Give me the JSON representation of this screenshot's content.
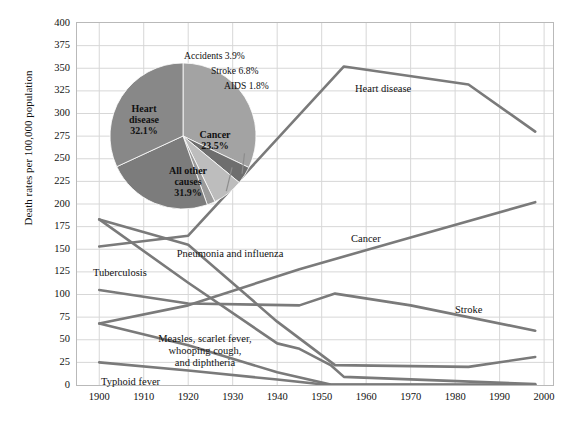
{
  "chart_data": {
    "type": "line",
    "title": "",
    "xlabel": "",
    "ylabel": "Death rates per 100,000 population",
    "xlim": [
      1895,
      2002
    ],
    "ylim": [
      0,
      400
    ],
    "ytick_step": 25,
    "grid": true,
    "legend_position": "inline-labels",
    "yticks": [
      "400",
      "375",
      "350",
      "325",
      "300",
      "275",
      "250",
      "225",
      "200",
      "175",
      "150",
      "125",
      "100",
      "75",
      "50",
      "25",
      "0"
    ],
    "xticks": [
      "1900",
      "1910",
      "1920",
      "1930",
      "1940",
      "1950",
      "1960",
      "1970",
      "1980",
      "1990",
      "2000"
    ],
    "series": [
      {
        "name": "Heart disease",
        "label": "Heart disease",
        "color": "#7a7a7a",
        "x": [
          1900,
          1920,
          1955,
          1983,
          1998
        ],
        "values": [
          153,
          165,
          352,
          332,
          280
        ]
      },
      {
        "name": "Cancer",
        "label": "Cancer",
        "color": "#7a7a7a",
        "x": [
          1900,
          1920,
          1945,
          1970,
          1998
        ],
        "values": [
          68,
          88,
          128,
          163,
          202
        ]
      },
      {
        "name": "Stroke",
        "label": "Stroke",
        "color": "#7a7a7a",
        "x": [
          1900,
          1920,
          1945,
          1953,
          1970,
          1998
        ],
        "values": [
          105,
          90,
          88,
          101,
          88,
          60
        ]
      },
      {
        "name": "Pneumonia and influenza",
        "label": "Pneumonia and influenza",
        "color": "#7a7a7a",
        "x": [
          1900,
          1920,
          1940,
          1950,
          1953,
          1983,
          1998
        ],
        "values": [
          183,
          155,
          70,
          33,
          22,
          20,
          31
        ]
      },
      {
        "name": "Tuberculosis",
        "label": "Tuberculosis",
        "color": "#7a7a7a",
        "x": [
          1900,
          1920,
          1940,
          1945,
          1952,
          1955,
          1998
        ],
        "values": [
          183,
          113,
          46,
          40,
          22,
          9,
          1
        ]
      },
      {
        "name": "Measles, scarlet fever, whooping cough, and diphtheria",
        "label": "Measles, scarlet fever,\nwhooping cough,\nand diphtheria",
        "color": "#7a7a7a",
        "x": [
          1900,
          1920,
          1940,
          1952,
          1998
        ],
        "values": [
          68,
          44,
          14,
          0.5,
          0.2
        ]
      },
      {
        "name": "Typhoid fever",
        "label": "Typhoid fever",
        "color": "#7a7a7a",
        "x": [
          1900,
          1920,
          1940,
          1950,
          1998
        ],
        "values": [
          25,
          16,
          6,
          0.8,
          0.2
        ]
      }
    ],
    "pie": {
      "title": "",
      "slices": [
        {
          "label": "Heart disease",
          "pct_label": "32.1%",
          "value": 32.1,
          "color": "#a3a3a3"
        },
        {
          "label": "Accidents",
          "pct_label": "3.9%",
          "value": 3.9,
          "color": "#6e6e6e"
        },
        {
          "label": "Stroke",
          "pct_label": "6.8%",
          "value": 6.8,
          "color": "#bdbdbd"
        },
        {
          "label": "AIDS",
          "pct_label": "1.8%",
          "value": 1.8,
          "color": "#9b9b9b"
        },
        {
          "label": "Cancer",
          "pct_label": "23.5%",
          "value": 23.5,
          "color": "#7c7c7c"
        },
        {
          "label": "All other causes",
          "pct_label": "31.9%",
          "value": 31.9,
          "color": "#888888"
        }
      ],
      "inside_labels": [
        {
          "name": "heart-disease",
          "text": "Heart\ndisease\n32.1%"
        },
        {
          "name": "cancer",
          "text": "Cancer\n23.5%"
        },
        {
          "name": "all-other-causes",
          "text": "All other\ncauses\n31.9%"
        }
      ],
      "callouts": [
        {
          "name": "accidents",
          "text": "Accidents 3.9%"
        },
        {
          "name": "stroke",
          "text": "Stroke 6.8%"
        },
        {
          "name": "aids",
          "text": "AIDS 1.8%"
        }
      ]
    },
    "colors": {
      "line": "#7a7a7a",
      "grid": "#d7d7d7",
      "frame": "#b9b9b9",
      "text": "#111111",
      "background": "#ffffff"
    }
  }
}
